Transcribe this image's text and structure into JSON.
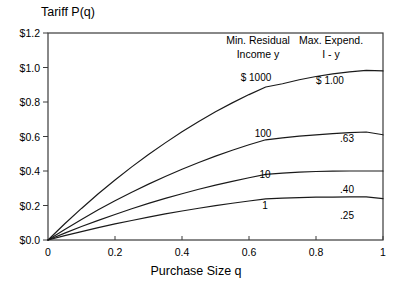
{
  "chart_data": {
    "type": "line",
    "title": "Tariff P(q)",
    "xlabel": "Purchase Size q",
    "ylabel": "Tariff P(q)",
    "xlim": [
      0,
      1
    ],
    "ylim": [
      0,
      1.2
    ],
    "grid": false,
    "legend_position": "inside-top-right",
    "x_ticks": [
      "0",
      "0.2",
      "0.4",
      "0.6",
      "0.8",
      "1"
    ],
    "x_tick_values": [
      0,
      0.2,
      0.4,
      0.6,
      0.8,
      1
    ],
    "y_ticks": [
      "$0.0",
      "$0.2",
      "$0.4",
      "$0.6",
      "$0.8",
      "$1.0",
      "$1.2"
    ],
    "y_tick_values": [
      0,
      0.2,
      0.4,
      0.6,
      0.8,
      1.0,
      1.2
    ],
    "legend_headers": {
      "left": "Min. Residual Income  y",
      "left_line1": "Min. Residual",
      "left_line2": "Income  y",
      "right": "Max. Expend. I - y",
      "right_line1": "Max. Expend.",
      "right_line2": "I - y"
    },
    "x": [
      0,
      0.05,
      0.1,
      0.15,
      0.2,
      0.25,
      0.3,
      0.35,
      0.4,
      0.45,
      0.5,
      0.55,
      0.6,
      0.65,
      0.7,
      0.75,
      0.8,
      0.85,
      0.9,
      0.95,
      1.0
    ],
    "series": [
      {
        "name": "y = $1000",
        "residual_income_label": "$ 1000",
        "max_expenditure_label": "$ 1.00",
        "max_expenditure_value": 1.0,
        "values": [
          0,
          0.094,
          0.183,
          0.268,
          0.348,
          0.424,
          0.496,
          0.563,
          0.627,
          0.687,
          0.743,
          0.795,
          0.843,
          0.887,
          0.906,
          0.929,
          0.948,
          0.963,
          0.975,
          0.983,
          0.98
        ]
      },
      {
        "name": "y = 100",
        "residual_income_label": "100",
        "max_expenditure_label": ".63",
        "max_expenditure_value": 0.63,
        "values": [
          0,
          0.061,
          0.119,
          0.175,
          0.227,
          0.277,
          0.324,
          0.368,
          0.41,
          0.449,
          0.486,
          0.52,
          0.552,
          0.581,
          0.592,
          0.602,
          0.61,
          0.617,
          0.622,
          0.626,
          0.61
        ]
      },
      {
        "name": "y = 10",
        "residual_income_label": "10",
        "max_expenditure_label": ".40",
        "max_expenditure_value": 0.4,
        "values": [
          0,
          0.04,
          0.078,
          0.114,
          0.148,
          0.181,
          0.212,
          0.241,
          0.268,
          0.294,
          0.318,
          0.34,
          0.361,
          0.38,
          0.388,
          0.393,
          0.397,
          0.399,
          0.4,
          0.4,
          0.4
        ]
      },
      {
        "name": "y = 1",
        "residual_income_label": "1",
        "max_expenditure_label": ".25",
        "max_expenditure_value": 0.25,
        "values": [
          0,
          0.025,
          0.049,
          0.072,
          0.093,
          0.113,
          0.133,
          0.151,
          0.168,
          0.184,
          0.199,
          0.213,
          0.226,
          0.238,
          0.243,
          0.246,
          0.248,
          0.249,
          0.25,
          0.25,
          0.24
        ]
      }
    ]
  }
}
